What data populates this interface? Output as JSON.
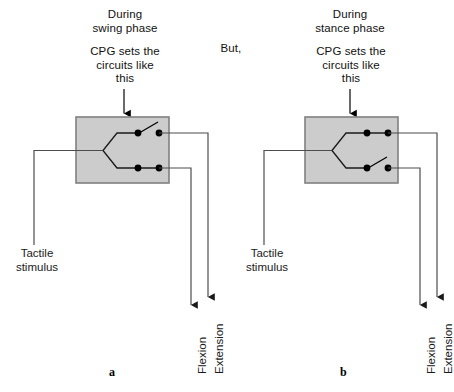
{
  "figure": {
    "type": "diagram",
    "background_color": "#ffffff",
    "box_fill_color": "#cccccc",
    "box_stroke_color": "#808080",
    "wire_color": "#4d4d4d",
    "switch_color": "#000000",
    "connector_text": "But,"
  },
  "panels": [
    {
      "id": "a",
      "label": "a",
      "heading": "During\nswing phase",
      "subheading": "CPG sets the\ncircuits like\nthis",
      "input_label": "Tactile\nstimulus",
      "outputs": [
        {
          "name": "flexion",
          "label": "Flexion",
          "row": "bottom",
          "state": "closed"
        },
        {
          "name": "extension",
          "label": "Extension",
          "row": "top",
          "state": "open"
        }
      ],
      "switches": [
        {
          "row": "top",
          "state": "open"
        },
        {
          "row": "bottom",
          "state": "closed"
        }
      ]
    },
    {
      "id": "b",
      "label": "b",
      "heading": "During\nstance phase",
      "subheading": "CPG sets the\ncircuits like\nthis",
      "input_label": "Tactile\nstimulus",
      "outputs": [
        {
          "name": "flexion",
          "label": "Flexion",
          "row": "bottom",
          "state": "open"
        },
        {
          "name": "extension",
          "label": "Extension",
          "row": "top",
          "state": "closed"
        }
      ],
      "switches": [
        {
          "row": "top",
          "state": "closed"
        },
        {
          "row": "bottom",
          "state": "open"
        }
      ]
    }
  ]
}
